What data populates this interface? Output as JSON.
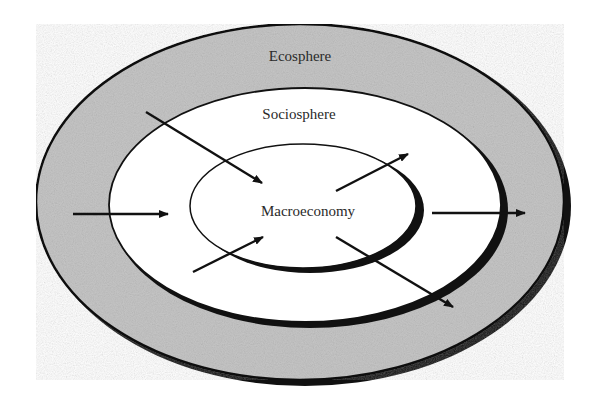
{
  "diagram": {
    "type": "nested-ellipses",
    "layers": [
      {
        "id": "ecosphere",
        "label": "Ecosphere",
        "fill": "#c8c8c8"
      },
      {
        "id": "sociosphere",
        "label": "Sociosphere",
        "fill": "#ffffff"
      },
      {
        "id": "macroeconomy",
        "label": "Macroeconomy",
        "fill": "#ffffff"
      }
    ],
    "arrows": [
      {
        "id": "flow-in-top-left",
        "direction": "inward",
        "from": "ecosphere",
        "to": "macroeconomy"
      },
      {
        "id": "flow-in-left",
        "direction": "inward",
        "from": "ecosphere",
        "to": "sociosphere"
      },
      {
        "id": "flow-in-bottom-left",
        "direction": "inward",
        "from": "sociosphere",
        "to": "macroeconomy"
      },
      {
        "id": "flow-out-top-right",
        "direction": "outward",
        "from": "macroeconomy",
        "to": "sociosphere"
      },
      {
        "id": "flow-out-right",
        "direction": "outward",
        "from": "sociosphere",
        "to": "ecosphere"
      },
      {
        "id": "flow-out-bottom-right",
        "direction": "outward",
        "from": "macroeconomy",
        "to": "ecosphere"
      }
    ],
    "colors": {
      "stroke": "#111111",
      "ecosphere_fill": "#c8c8c8",
      "background": "#ffffff"
    }
  }
}
